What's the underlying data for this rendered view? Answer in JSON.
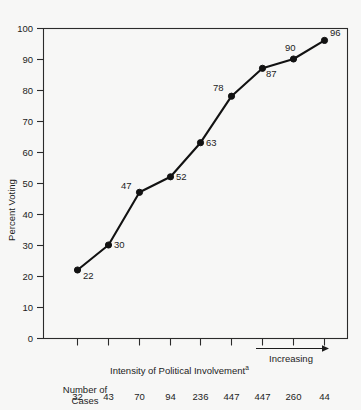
{
  "chart_data": {
    "type": "line",
    "title": "",
    "xlabel": "Intensity of Political Involvement",
    "xlabel_superscript": "a",
    "ylabel": "Percent Voting",
    "ylim": [
      0,
      100
    ],
    "yticks": [
      0,
      10,
      20,
      30,
      40,
      50,
      60,
      70,
      80,
      90,
      100
    ],
    "ytick_labels": [
      "0",
      "10",
      "20",
      "30",
      "40",
      "50",
      "60",
      "70",
      "80",
      "90",
      "100"
    ],
    "grid": false,
    "legend": "none",
    "x": [
      1,
      2,
      3,
      4,
      5,
      6,
      7,
      8,
      9
    ],
    "values": [
      22,
      30,
      47,
      52,
      63,
      78,
      87,
      90,
      96
    ],
    "point_labels": [
      "22",
      "30",
      "47",
      "52",
      "63",
      "78",
      "87",
      "90",
      "96"
    ],
    "annotations": {
      "direction_arrow_label": "Increasing"
    },
    "secondary_axis": {
      "label_line1": "Number of",
      "label_line2": "Cases",
      "values": [
        "32",
        "43",
        "70",
        "94",
        "236",
        "447",
        "447",
        "260",
        "44"
      ]
    },
    "colors": {
      "line": "#121212",
      "marker": "#121212",
      "axis": "#2b2b2b",
      "background": "#f7f7f6",
      "text": "#1c1c1c"
    }
  }
}
